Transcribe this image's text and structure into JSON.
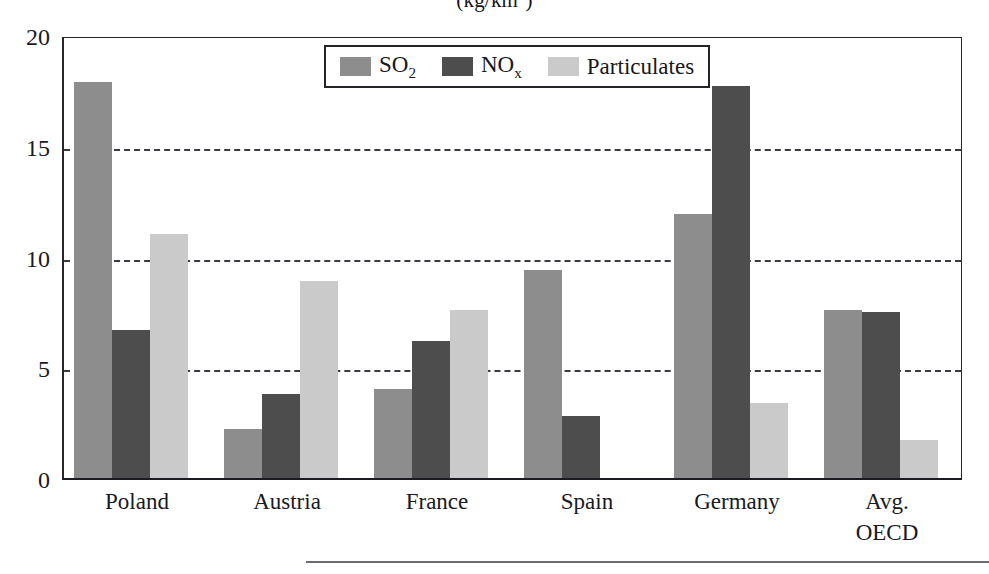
{
  "chart_data": {
    "type": "bar",
    "title": "(kg/km2)",
    "title_display": "(kg/km",
    "title_sup": "2",
    "title_tail": ")",
    "xlabel": "",
    "ylabel": "",
    "ylim": [
      0,
      20
    ],
    "yticks": [
      0,
      5,
      10,
      15,
      20
    ],
    "ytick_labels": [
      "0",
      "5",
      "10",
      "15",
      "20"
    ],
    "grid": "horizontal-dashed",
    "gridlines_at": [
      5,
      10,
      15
    ],
    "legend_position": "top-center-inside",
    "categories": [
      "Poland",
      "Austria",
      "France",
      "Spain",
      "Germany",
      "Avg.\nOECD"
    ],
    "series": [
      {
        "name": "SO2",
        "label": "SO",
        "sub": "2",
        "color": "#8d8d8d",
        "values": [
          17.9,
          2.2,
          4.0,
          9.4,
          11.9,
          7.6
        ]
      },
      {
        "name": "NOx",
        "label": "NO",
        "sub": "x",
        "color": "#4d4d4d",
        "values": [
          6.7,
          3.8,
          6.2,
          2.8,
          17.7,
          7.5
        ]
      },
      {
        "name": "Particulates",
        "label": "Particulates",
        "sub": "",
        "color": "#cacaca",
        "values": [
          11.0,
          8.9,
          7.6,
          0,
          3.4,
          1.7
        ]
      }
    ]
  },
  "legend": {
    "items": [
      {
        "label": "SO",
        "sub": "2",
        "swatch": "so2"
      },
      {
        "label": "NO",
        "sub": "x",
        "swatch": "nox"
      },
      {
        "label": "Particulates",
        "sub": "",
        "swatch": "part"
      }
    ]
  },
  "axis": {
    "y_labels": [
      "20",
      "15",
      "10",
      "5",
      "0"
    ],
    "x_labels": [
      "Poland",
      "Austria",
      "France",
      "Spain",
      "Germany",
      "Avg.\nOECD"
    ]
  }
}
